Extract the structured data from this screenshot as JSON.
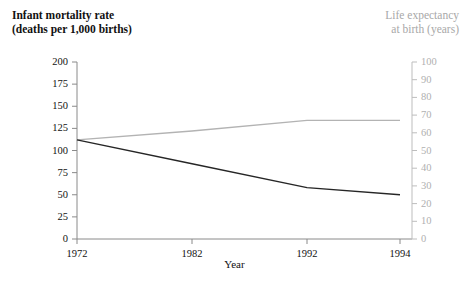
{
  "chart_data": {
    "type": "line",
    "title": "",
    "xlabel": "Year",
    "x": [
      1972,
      1982,
      1992,
      1994
    ],
    "categories": [
      "1972",
      "1982",
      "1992",
      "1994"
    ],
    "grid": false,
    "legend": "none",
    "series": [
      {
        "name": "Infant mortality rate (deaths per 1,000 births)",
        "axis": "left",
        "color": "#262626",
        "values": [
          112,
          85,
          58,
          50
        ]
      },
      {
        "name": "Life expectancy at birth (years)",
        "axis": "right",
        "color": "#b3b3b3",
        "values": [
          56,
          61,
          67,
          67
        ]
      }
    ],
    "left_axis": {
      "label_line1": "Infant mortality rate",
      "label_line2": "(deaths per 1,000 births)",
      "ticks": [
        "200",
        "175",
        "150",
        "125",
        "100",
        "75",
        "50",
        "25",
        "0"
      ],
      "tick_values": [
        200,
        175,
        150,
        125,
        100,
        75,
        50,
        25,
        0
      ],
      "ylim": [
        0,
        200
      ],
      "color": "#111111"
    },
    "right_axis": {
      "label_line1": "Life expectancy",
      "label_line2": "at birth (years)",
      "ticks": [
        "100",
        "90",
        "80",
        "70",
        "60",
        "50",
        "40",
        "30",
        "20",
        "10",
        "0"
      ],
      "tick_values": [
        100,
        90,
        80,
        70,
        60,
        50,
        40,
        30,
        20,
        10,
        0
      ],
      "ylim": [
        0,
        100
      ],
      "color": "#b0b0b0"
    },
    "x_axis": {
      "label": "Year",
      "ticks": [
        "1972",
        "1982",
        "1992",
        "1994"
      ]
    }
  }
}
